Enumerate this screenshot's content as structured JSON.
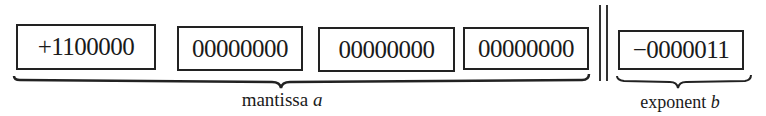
{
  "figure": {
    "mantissa": {
      "words": [
        "+1100000",
        "00000000",
        "00000000",
        "00000000"
      ],
      "label_text": "mantissa ",
      "label_var": "a"
    },
    "exponent": {
      "word": "−0000011",
      "label_text": "exponent ",
      "label_var": "b"
    },
    "separator": "double-vertical-line"
  }
}
